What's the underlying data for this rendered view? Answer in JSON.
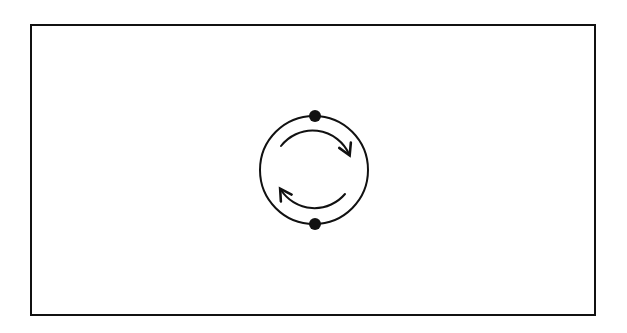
{
  "diagram": {
    "colors": {
      "background": "#ffffff",
      "stroke": "#111111"
    },
    "frame": {
      "x": 31,
      "y": 25,
      "width": 564,
      "height": 290
    },
    "loop": {
      "cx": 314,
      "cy": 170,
      "r": 54
    },
    "nodes": [
      {
        "id": "top-node",
        "cx": 315,
        "cy": 116,
        "r": 6
      },
      {
        "id": "bottom-node",
        "cx": 315,
        "cy": 224,
        "r": 6
      }
    ],
    "arrows": [
      {
        "id": "upper-arrow",
        "direction": "clockwise",
        "from": "upper-left",
        "to": "right"
      },
      {
        "id": "lower-arrow",
        "direction": "clockwise",
        "from": "lower-right",
        "to": "left"
      }
    ]
  }
}
